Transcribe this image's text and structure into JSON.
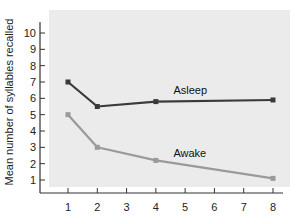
{
  "chart_data": {
    "type": "line",
    "title": "",
    "xlabel": "",
    "ylabel": "Mean number of syllables recalled",
    "x_ticks": [
      1,
      2,
      3,
      4,
      5,
      6,
      7,
      8
    ],
    "y_ticks": [
      1,
      2,
      3,
      4,
      5,
      6,
      7,
      8,
      9,
      10
    ],
    "xlim": [
      0.1,
      8.35
    ],
    "ylim": [
      0,
      10.6
    ],
    "grid": false,
    "legend": "inline labels",
    "series": [
      {
        "name": "Asleep",
        "x": [
          1,
          2,
          4,
          8
        ],
        "values": [
          7.0,
          5.5,
          5.8,
          5.9
        ],
        "color": "#3a3a3a",
        "label_at": [
          4.6,
          6.25
        ]
      },
      {
        "name": "Awake",
        "x": [
          1,
          2,
          4,
          8
        ],
        "values": [
          5.0,
          3.0,
          2.2,
          1.1
        ],
        "color": "#9a9a9a",
        "label_at": [
          4.6,
          2.4
        ]
      }
    ]
  },
  "colors": {
    "panel": "#ebebeb",
    "axis": "#333333"
  }
}
